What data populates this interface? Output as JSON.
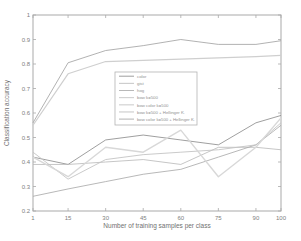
{
  "chart_data": {
    "type": "line",
    "title": "",
    "xlabel": "Number of training samples per class",
    "ylabel": "Classification accuracy",
    "xlim": [
      1,
      100
    ],
    "ylim": [
      0.2,
      1
    ],
    "x_ticks": [
      1,
      15,
      30,
      45,
      60,
      75,
      90,
      100
    ],
    "y_ticks": [
      0.2,
      0.3,
      0.4,
      0.5,
      0.6,
      0.7,
      0.8,
      0.9,
      1
    ],
    "grid": false,
    "background": "#ffffff",
    "axis_color": "#a9a9a9",
    "tick_label_color": "#808080",
    "label_color": "#707070",
    "legend": {
      "position": "inside-upper-middle",
      "border_color": "#b3b3b3",
      "text_color": "#8f8f8f",
      "background": "#ffffff"
    },
    "x": [
      1,
      15,
      30,
      45,
      60,
      75,
      90,
      100
    ],
    "series": [
      {
        "name": "color",
        "color": "#878787",
        "line_width": 0.8,
        "values": [
          0.42,
          0.39,
          0.49,
          0.51,
          0.49,
          0.47,
          0.56,
          0.59
        ]
      },
      {
        "name": "gist",
        "color": "#b8b8b8",
        "line_width": 0.8,
        "values": [
          0.39,
          0.39,
          0.4,
          0.41,
          0.39,
          0.46,
          0.46,
          0.45
        ]
      },
      {
        "name": "hog",
        "color": "#a6a6a6",
        "line_width": 0.8,
        "values": [
          0.26,
          0.29,
          0.32,
          0.35,
          0.37,
          0.42,
          0.47,
          0.55
        ]
      },
      {
        "name": "bow k=500",
        "color": "#c4c4c4",
        "line_width": 0.9,
        "values": [
          0.44,
          0.33,
          0.41,
          0.43,
          0.44,
          0.45,
          0.47,
          0.56
        ]
      },
      {
        "name": "bow color k=500",
        "color": "#d8d8d8",
        "line_width": 1.4,
        "values": [
          0.42,
          0.34,
          0.46,
          0.44,
          0.53,
          0.34,
          0.46,
          0.58
        ]
      },
      {
        "name": "bow k=500 + Hellinger K.",
        "color": "#cfcfcf",
        "line_width": 1.2,
        "values": [
          0.55,
          0.76,
          0.81,
          0.815,
          0.82,
          0.825,
          0.83,
          0.835
        ]
      },
      {
        "name": "bow color k=500 + Hellinger K.",
        "color": "#9e9e9e",
        "line_width": 0.8,
        "values": [
          0.56,
          0.805,
          0.855,
          0.875,
          0.9,
          0.88,
          0.88,
          0.895
        ]
      }
    ]
  }
}
